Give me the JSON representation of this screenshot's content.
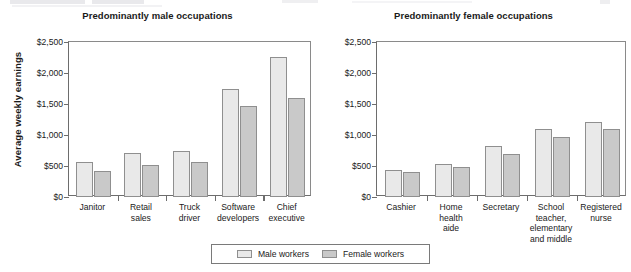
{
  "figure": {
    "y_axis_title": "Average weekly earnings",
    "legend": [
      {
        "label": "Male workers",
        "color": "#e9e9e9"
      },
      {
        "label": "Female workers",
        "color": "#c9c9c9"
      }
    ]
  },
  "chart_data": [
    {
      "type": "bar",
      "title": "Predominantly male occupations",
      "xlabel": "",
      "ylabel": "Average weekly earnings",
      "ylim": [
        0,
        2500
      ],
      "yticks": [
        0,
        500,
        1000,
        1500,
        2000,
        2500
      ],
      "ytick_labels": [
        "$0",
        "$500",
        "$1,000",
        "$1,500",
        "$2,000",
        "$2,500"
      ],
      "grid": false,
      "legend_position": "bottom-center",
      "categories": [
        "Janitor",
        "Retail\nsales",
        "Truck\ndriver",
        "Software\ndevelopers",
        "Chief\nexecutive"
      ],
      "series": [
        {
          "name": "Male workers",
          "color": "#e9e9e9",
          "values": [
            560,
            710,
            740,
            1740,
            2260
          ]
        },
        {
          "name": "Female workers",
          "color": "#c9c9c9",
          "values": [
            420,
            510,
            560,
            1470,
            1590
          ]
        }
      ]
    },
    {
      "type": "bar",
      "title": "Predominantly female occupations",
      "xlabel": "",
      "ylabel": "Average weekly earnings",
      "ylim": [
        0,
        2500
      ],
      "yticks": [
        0,
        500,
        1000,
        1500,
        2000,
        2500
      ],
      "ytick_labels": [
        "$0",
        "$500",
        "$1,000",
        "$1,500",
        "$2,000",
        "$2,500"
      ],
      "grid": false,
      "legend_position": "bottom-center",
      "categories": [
        "Cashier",
        "Home\nhealth\naide",
        "Secretary",
        "School\nteacher,\nelementary\nand middle",
        "Registered\nnurse"
      ],
      "series": [
        {
          "name": "Male workers",
          "color": "#e9e9e9",
          "values": [
            430,
            540,
            820,
            1100,
            1210
          ]
        },
        {
          "name": "Female workers",
          "color": "#c9c9c9",
          "values": [
            400,
            480,
            690,
            960,
            1090
          ]
        }
      ]
    }
  ]
}
